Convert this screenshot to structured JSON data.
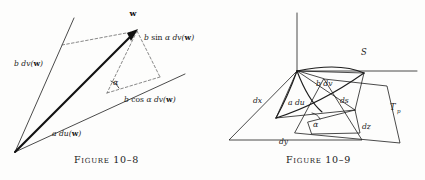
{
  "page": {
    "background_color": "#fdfdfc",
    "ink_color": "#1a1a1a",
    "dashed_color": "#555555"
  },
  "figures": [
    {
      "id": "figure-10-8",
      "caption": "Figure 10–8",
      "description": "Vector decomposition parallelogram",
      "point_labels": {
        "w_vertex": "w"
      },
      "labels": {
        "b_dv_w": "b dv(w)",
        "a_du_w": "a du(w)",
        "b_sin_alpha_dv_w": "b sin α dv(w)",
        "b_cos_alpha_dv_w": "b cos α dv(w)",
        "alpha": "α"
      }
    },
    {
      "id": "figure-10-9",
      "caption": "Figure 10–9",
      "description": "Surface patch S with tangent plane T_p",
      "labels": {
        "surface": "S",
        "tangent_plane": "T",
        "tangent_plane_subscript": "p",
        "b_dv": "b dv",
        "a_du": "a du",
        "ds": "ds",
        "dx": "dx",
        "dy": "dy",
        "dz": "dz",
        "alpha": "α"
      }
    }
  ]
}
